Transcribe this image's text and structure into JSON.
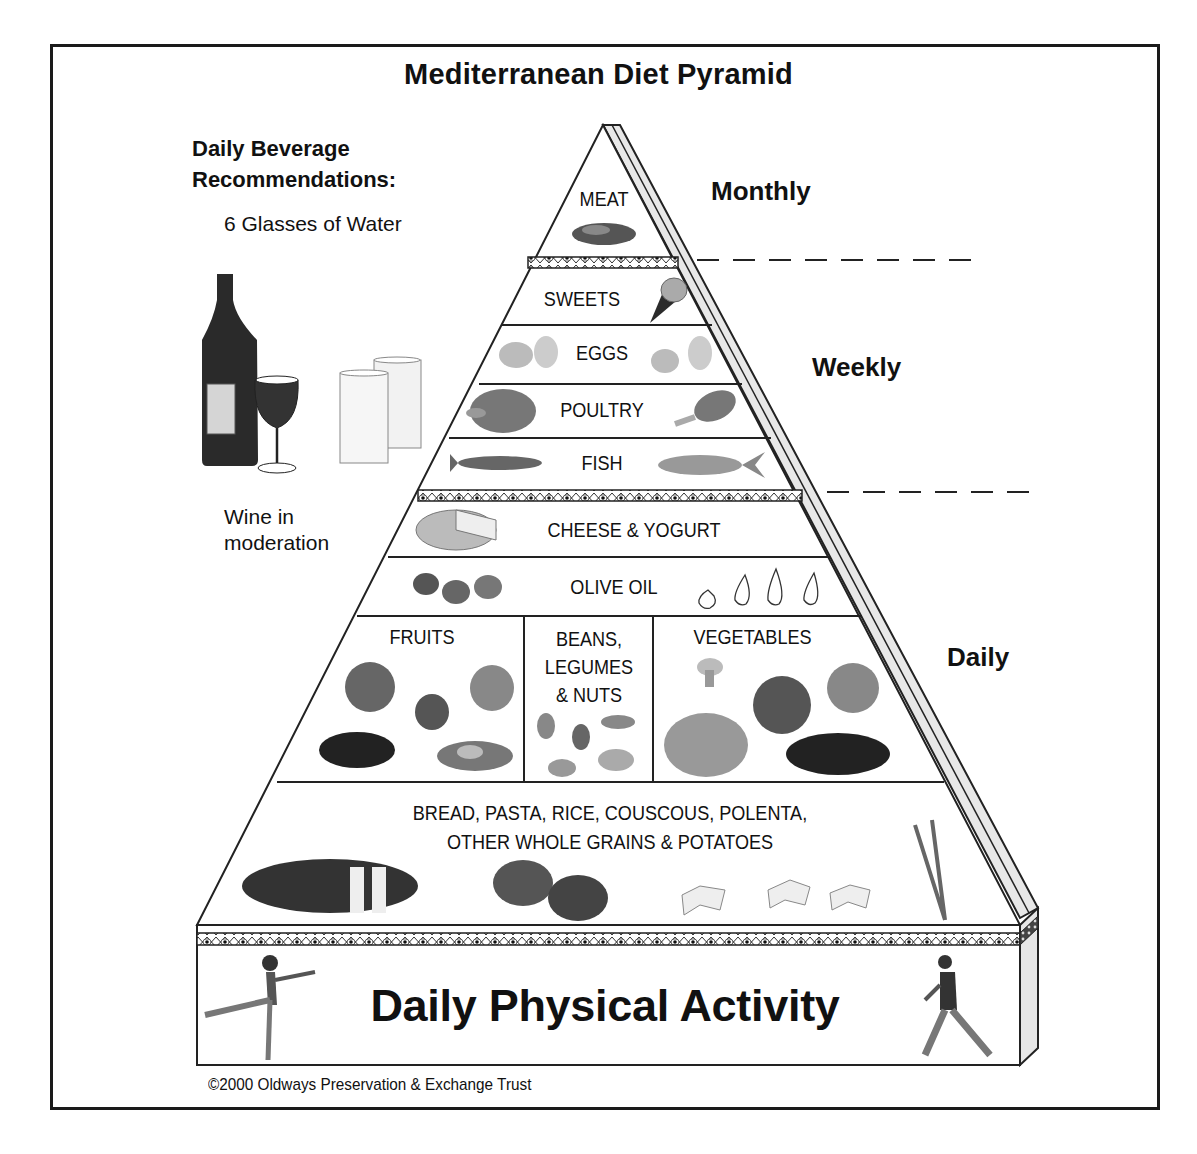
{
  "title": "Mediterranean Diet Pyramid",
  "beverages": {
    "heading_line1": "Daily Beverage",
    "heading_line2": "Recommendations:",
    "water": "6 Glasses of Water",
    "wine_line1": "Wine in",
    "wine_line2": "moderation",
    "icons": [
      "wine-bottle-icon",
      "wine-glass-icon",
      "water-glasses-icon"
    ]
  },
  "frequency": {
    "monthly": "Monthly",
    "weekly": "Weekly",
    "daily": "Daily"
  },
  "tiers": [
    {
      "label": "MEAT",
      "frequency": "Monthly",
      "icons": [
        "steak-icon"
      ]
    },
    {
      "label": "SWEETS",
      "frequency": "Weekly",
      "icons": [
        "ice-cream-cone-icon"
      ]
    },
    {
      "label": "EGGS",
      "frequency": "Weekly",
      "icons": [
        "eggs-icon",
        "eggs-icon"
      ]
    },
    {
      "label": "POULTRY",
      "frequency": "Weekly",
      "icons": [
        "roast-chicken-icon",
        "drumstick-icon"
      ]
    },
    {
      "label": "FISH",
      "frequency": "Weekly",
      "icons": [
        "fish-icon",
        "fish-icon"
      ]
    },
    {
      "label": "CHEESE & YOGURT",
      "frequency": "Daily",
      "icons": [
        "cheese-wheel-icon"
      ]
    },
    {
      "label": "OLIVE OIL",
      "frequency": "Daily",
      "icons": [
        "olives-icon",
        "oil-drops-icon"
      ]
    },
    {
      "label": "FRUITS",
      "frequency": "Daily",
      "icons": [
        "apple-icon",
        "strawberry-icon",
        "peach-icon",
        "grapes-icon",
        "avocado-icon"
      ]
    },
    {
      "label": "BEANS, LEGUMES & NUTS",
      "label_lines": [
        "BEANS,",
        "LEGUMES",
        "& NUTS"
      ],
      "frequency": "Daily",
      "icons": [
        "almond-icon",
        "cashew-icon",
        "peanut-icon"
      ]
    },
    {
      "label": "VEGETABLES",
      "frequency": "Daily",
      "icons": [
        "mushroom-icon",
        "tomato-icon",
        "onion-icon",
        "cabbage-icon",
        "eggplant-icon"
      ]
    },
    {
      "label": "BREAD, PASTA, RICE, COUSCOUS, POLENTA, OTHER WHOLE GRAINS & POTATOES",
      "label_lines": [
        "BREAD, PASTA, RICE, COUSCOUS, POLENTA,",
        "OTHER WHOLE GRAINS & POTATOES"
      ],
      "frequency": "Daily",
      "icons": [
        "bread-loaf-icon",
        "potatoes-icon",
        "pasta-bowtie-icon",
        "pasta-bowtie-icon",
        "pasta-bowtie-icon",
        "wheat-icon"
      ]
    }
  ],
  "base": {
    "label": "Daily Physical Activity",
    "icons": [
      "dancer-figure-icon",
      "walking-man-icon"
    ]
  },
  "copyright": "©2000 Oldways Preservation & Exchange Trust",
  "colors": {
    "ink": "#111111",
    "side_face": "#e6e6e6",
    "background": "#ffffff"
  }
}
